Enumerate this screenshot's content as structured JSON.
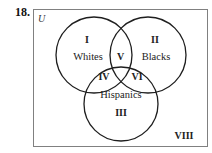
{
  "problem": {
    "number": "18."
  },
  "diagram": {
    "universe_label": "U",
    "sets": [
      {
        "name": "Whites",
        "region": "I"
      },
      {
        "name": "Blacks",
        "region": "II"
      },
      {
        "name": "Hispanics",
        "region": "III"
      }
    ],
    "regions": {
      "whites_only": "I",
      "blacks_only": "II",
      "hispanics_only": "III",
      "whites_hispanics": "IV",
      "whites_blacks": "V",
      "blacks_hispanics": "VI",
      "outside": "VIII"
    },
    "colors": {
      "frame": "#808080",
      "circles": "#1e1e1e",
      "text": "#222222"
    }
  }
}
